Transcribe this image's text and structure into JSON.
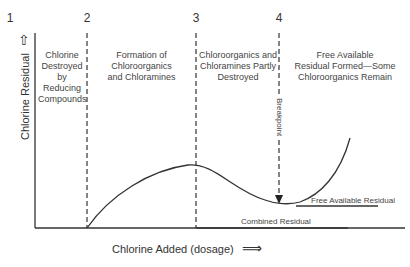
{
  "diagram": {
    "zone_numbers": [
      "1",
      "2",
      "3",
      "4"
    ],
    "zones": [
      {
        "label": "Chlorine Destroyed by Reducing Compounds"
      },
      {
        "label": "Formation of Chloroorganics and Chloramines"
      },
      {
        "label": "Chloroorganics and Chloramines Partly Destroyed"
      },
      {
        "label": "Free Available Residual Formed—Some Chloroorganics Remain"
      }
    ],
    "zone_lines": {
      "l1": [
        "Chlorine",
        "Destroyed",
        "by",
        "Reducing",
        "Compounds"
      ],
      "l2": [
        "Formation of Chloroorganics",
        "and Chloramines"
      ],
      "l3": [
        "Chloroorganics and",
        "Chloramines Partly",
        "Destroyed"
      ],
      "l4": [
        "Free Available",
        "Residual Formed—Some",
        "Chloroorganics Remain"
      ]
    },
    "y_axis_label": "Chlorine Residual",
    "x_axis_label": "Chlorine Added (dosage)",
    "arrow_up": "⇧",
    "arrow_right": "⟹",
    "breakpoint_label": "Breakpoint",
    "free_residual_label": "Free Available Residual",
    "combined_residual_label": "Combined Residual"
  }
}
